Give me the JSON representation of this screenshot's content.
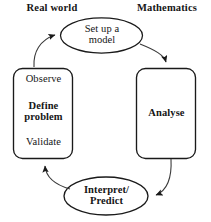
{
  "figure": {
    "background_color": "#ffffff",
    "stroke_color": "#1a1a1a",
    "text_color": "#151515"
  },
  "headings": {
    "left": "Real world",
    "right": "Mathematics"
  },
  "nodes": {
    "setup": {
      "label": "Set up a\nmodel",
      "shape": "ellipse",
      "bold": false
    },
    "left_box": {
      "shape": "rounded-rect",
      "lines": [
        {
          "text": "Observe",
          "bold": false
        },
        {
          "text": "Define\nproblem",
          "bold": true
        },
        {
          "text": "Validate",
          "bold": false
        }
      ]
    },
    "right_box": {
      "shape": "rounded-rect",
      "label": "Analyse",
      "bold": true
    },
    "interpret": {
      "label": "Interpret/\nPredict",
      "shape": "ellipse",
      "bold": true
    }
  },
  "arrows": [
    {
      "name": "define-problem-to-set-up-a-model",
      "from": "left_box",
      "to": "setup",
      "direction": "up-right"
    },
    {
      "name": "set-up-a-model-to-analyse",
      "from": "setup",
      "to": "right_box",
      "direction": "down-right"
    },
    {
      "name": "analyse-to-interpret-predict",
      "from": "right_box",
      "to": "interpret",
      "direction": "down-left"
    },
    {
      "name": "interpret-predict-to-define-problem",
      "from": "interpret",
      "to": "left_box",
      "direction": "up-left"
    }
  ]
}
